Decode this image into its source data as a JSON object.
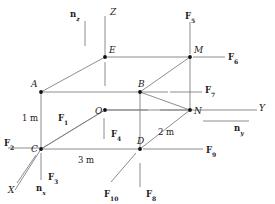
{
  "figure": {
    "type": "free-body-diagram",
    "width": 275,
    "height": 204,
    "background": "#ffffff",
    "line_color": "#808080",
    "text_color": "#1a1a1a"
  },
  "geometry": {
    "vertices": [
      {
        "name": "A",
        "x": 41,
        "y": 92,
        "label_dx": -10,
        "label_dy": -12
      },
      {
        "name": "B",
        "x": 140,
        "y": 92,
        "label_dx": -2,
        "label_dy": -12
      },
      {
        "name": "C",
        "x": 41,
        "y": 149,
        "label_dx": -10,
        "label_dy": -4
      },
      {
        "name": "D",
        "x": 140,
        "y": 149,
        "label_dx": -3,
        "label_dy": -12
      },
      {
        "name": "E",
        "x": 105,
        "y": 57,
        "label_dx": 4,
        "label_dy": -11
      },
      {
        "name": "M",
        "x": 190,
        "y": 57,
        "label_dx": 4,
        "label_dy": -11
      },
      {
        "name": "N",
        "x": 190,
        "y": 110,
        "label_dx": 4,
        "label_dy": -3
      },
      {
        "name": "O",
        "x": 105,
        "y": 110,
        "label_dx": -10,
        "label_dy": -3
      }
    ],
    "edges": [
      [
        "A",
        "B"
      ],
      [
        "A",
        "C"
      ],
      [
        "C",
        "D"
      ],
      [
        "B",
        "D"
      ],
      [
        "E",
        "M"
      ],
      [
        "E",
        "A"
      ],
      [
        "M",
        "B"
      ],
      [
        "M",
        "N"
      ],
      [
        "N",
        "D"
      ],
      [
        "N",
        "O"
      ],
      [
        "O",
        "C"
      ],
      [
        "B",
        "N"
      ]
    ]
  },
  "axes": [
    {
      "name": "Z",
      "label": "Z",
      "from_x": 105,
      "from_y": 57,
      "to_x": 105,
      "to_y": 16,
      "label_x": 110,
      "label_y": 8
    },
    {
      "name": "Y",
      "label": "Y",
      "from_x": 190,
      "from_y": 110,
      "to_x": 257,
      "to_y": 110,
      "label_x": 259,
      "label_y": 104
    },
    {
      "name": "X",
      "label": "X",
      "from_x": 41,
      "from_y": 149,
      "to_x": 15,
      "to_y": 190,
      "label_x": 8,
      "label_y": 186
    }
  ],
  "normals": [
    {
      "name": "n_z",
      "base": "n",
      "sub": "z",
      "tick_x1": 85,
      "tick_y1": 21,
      "tick_x2": 85,
      "tick_y2": 46,
      "label_x": 70,
      "label_y": 10
    },
    {
      "name": "n_y",
      "base": "n",
      "sub": "y",
      "tick_x1": 203,
      "tick_y1": 121,
      "tick_x2": 249,
      "tick_y2": 121,
      "label_x": 234,
      "label_y": 124
    },
    {
      "name": "n_x",
      "base": "n",
      "sub": "x",
      "tick_x1": 36,
      "tick_y1": 155,
      "tick_x2": 17,
      "tick_y2": 183,
      "label_x": 36,
      "label_y": 184
    }
  ],
  "dimensions": [
    {
      "name": "height-1m",
      "text": "1 m",
      "x": 22,
      "y": 114
    },
    {
      "name": "depth-2m",
      "text": "2 m",
      "x": 158,
      "y": 128
    },
    {
      "name": "width-3m",
      "text": "3 m",
      "x": 78,
      "y": 156
    }
  ],
  "forces": [
    {
      "name": "F1",
      "base": "F",
      "sub": "1",
      "label_x": 58,
      "label_y": 114,
      "line": {
        "x1": 41,
        "y1": 149,
        "x2": 103,
        "y2": 111
      },
      "orientation": "diagonal"
    },
    {
      "name": "F2",
      "base": "F",
      "sub": "2",
      "label_x": 4,
      "label_y": 139,
      "line": {
        "x1": 8,
        "y1": 148,
        "x2": 39,
        "y2": 148
      },
      "orientation": "horizontal"
    },
    {
      "name": "F3",
      "base": "F",
      "sub": "3",
      "label_x": 48,
      "label_y": 173,
      "line": {
        "x1": 41,
        "y1": 153,
        "x2": 41,
        "y2": 180
      },
      "orientation": "vertical"
    },
    {
      "name": "F4",
      "base": "F",
      "sub": "4",
      "label_x": 111,
      "label_y": 130,
      "line": {
        "x1": 104,
        "y1": 118,
        "x2": 104,
        "y2": 139
      },
      "orientation": "vertical"
    },
    {
      "name": "F5",
      "base": "F",
      "sub": "5",
      "label_x": 185,
      "label_y": 12,
      "line": {
        "x1": 190,
        "y1": 22,
        "x2": 190,
        "y2": 54
      },
      "orientation": "vertical"
    },
    {
      "name": "F6",
      "base": "F",
      "sub": "6",
      "label_x": 228,
      "label_y": 53,
      "line": {
        "x1": 193,
        "y1": 57,
        "x2": 225,
        "y2": 57
      },
      "orientation": "horizontal"
    },
    {
      "name": "F7",
      "base": "F",
      "sub": "7",
      "label_x": 205,
      "label_y": 86,
      "line": {
        "x1": 170,
        "y1": 92,
        "x2": 202,
        "y2": 92
      },
      "orientation": "horizontal"
    },
    {
      "name": "F8",
      "base": "F",
      "sub": "8",
      "label_x": 146,
      "label_y": 190,
      "line": {
        "x1": 140,
        "y1": 163,
        "x2": 140,
        "y2": 187
      },
      "orientation": "vertical"
    },
    {
      "name": "F9",
      "base": "F",
      "sub": "9",
      "label_x": 206,
      "label_y": 146,
      "line": {
        "x1": 143,
        "y1": 149,
        "x2": 203,
        "y2": 149
      },
      "orientation": "horizontal"
    },
    {
      "name": "F10",
      "base": "F",
      "sub": "10",
      "label_x": 104,
      "label_y": 190,
      "line": {
        "x1": 136,
        "y1": 153,
        "x2": 111,
        "y2": 182
      },
      "orientation": "diagonal"
    }
  ],
  "extra_lines": [
    {
      "name": "o-horizontal-leader",
      "x1": 107,
      "y1": 110,
      "x2": 148,
      "y2": 110
    },
    {
      "name": "n-left-leader",
      "x1": 160,
      "y1": 110,
      "x2": 188,
      "y2": 110
    },
    {
      "name": "z-axis-tick",
      "x1": 105,
      "y1": 62,
      "x2": 105,
      "y2": 86
    },
    {
      "name": "b-right-leader",
      "x1": 142,
      "y1": 92,
      "x2": 168,
      "y2": 92
    }
  ]
}
